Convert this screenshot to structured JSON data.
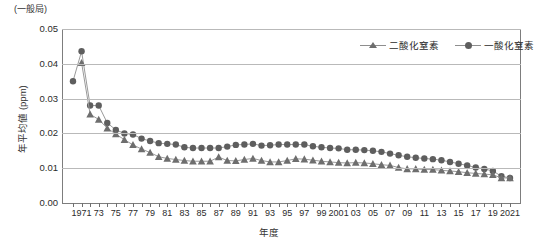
{
  "corner_note": "(一般局)",
  "axis": {
    "ylabel": "年平均値 (ppm)",
    "xlabel": "年度",
    "ytick_labels": [
      "0.05",
      "0.04",
      "0.03",
      "0.02",
      "0.01",
      "0.00"
    ]
  },
  "legend": {
    "position": "top-right",
    "items": [
      {
        "label": "二酸化窒素",
        "marker": "triangle",
        "color": "#6e6e6e"
      },
      {
        "label": "一酸化窒素",
        "marker": "circle",
        "color": "#5e5e5e"
      }
    ]
  },
  "chart_data": {
    "type": "line",
    "title": "",
    "subtitle": "(一般局)",
    "xlabel": "年度",
    "ylabel": "年平均値 (ppm)",
    "ylim": [
      0.0,
      0.05
    ],
    "ytick_values": [
      0.0,
      0.01,
      0.02,
      0.03,
      0.04,
      0.05
    ],
    "grid": "horizontal",
    "legend_position": "top-right",
    "x": [
      1970,
      1971,
      1972,
      1973,
      1974,
      1975,
      1976,
      1977,
      1978,
      1979,
      1980,
      1981,
      1982,
      1983,
      1984,
      1985,
      1986,
      1987,
      1988,
      1989,
      1990,
      1991,
      1992,
      1993,
      1994,
      1995,
      1996,
      1997,
      1998,
      1999,
      2000,
      2001,
      2002,
      2003,
      2004,
      2005,
      2006,
      2007,
      2008,
      2009,
      2010,
      2011,
      2012,
      2013,
      2014,
      2015,
      2016,
      2017,
      2018,
      2019,
      2020,
      2021
    ],
    "xtick_labels": [
      "1971",
      "73",
      "75",
      "77",
      "79",
      "81",
      "83",
      "85",
      "87",
      "89",
      "91",
      "93",
      "95",
      "97",
      "99",
      "2001",
      "03",
      "05",
      "07",
      "09",
      "11",
      "13",
      "15",
      "17",
      "19",
      "2021"
    ],
    "xtick_values": [
      1971,
      1973,
      1975,
      1977,
      1979,
      1981,
      1983,
      1985,
      1987,
      1989,
      1991,
      1993,
      1995,
      1997,
      1999,
      2001,
      2003,
      2005,
      2007,
      2009,
      2011,
      2013,
      2015,
      2017,
      2019,
      2021
    ],
    "series": [
      {
        "name": "一酸化窒素",
        "marker": "circle",
        "color": "#5e5e5e",
        "values": [
          0.035,
          0.0436,
          0.028,
          0.028,
          0.023,
          0.021,
          0.02,
          0.0197,
          0.0185,
          0.0178,
          0.0172,
          0.017,
          0.0168,
          0.016,
          0.0158,
          0.0158,
          0.0158,
          0.0158,
          0.0162,
          0.0167,
          0.0168,
          0.017,
          0.0165,
          0.0166,
          0.0168,
          0.0168,
          0.0168,
          0.0168,
          0.0163,
          0.016,
          0.0158,
          0.0157,
          0.0153,
          0.0153,
          0.0152,
          0.015,
          0.0147,
          0.0142,
          0.0137,
          0.0133,
          0.013,
          0.0128,
          0.0126,
          0.0123,
          0.0118,
          0.0113,
          0.0108,
          0.0102,
          0.0098,
          0.0092,
          0.0077,
          0.0072
        ]
      },
      {
        "name": "二酸化窒素",
        "marker": "triangle",
        "color": "#6e6e6e",
        "values": [
          null,
          0.0403,
          0.0255,
          0.024,
          0.0215,
          0.0198,
          0.0182,
          0.0167,
          0.0155,
          0.0145,
          0.0133,
          0.0128,
          0.0125,
          0.0122,
          0.012,
          0.012,
          0.012,
          0.0132,
          0.0122,
          0.0121,
          0.0125,
          0.0128,
          0.0122,
          0.0118,
          0.0118,
          0.0122,
          0.0127,
          0.0126,
          0.0123,
          0.012,
          0.0118,
          0.0116,
          0.0115,
          0.0116,
          0.0115,
          0.0113,
          0.011,
          0.0108,
          0.0102,
          0.0098,
          0.0098,
          0.0096,
          0.0096,
          0.0094,
          0.0092,
          0.009,
          0.0087,
          0.0085,
          0.0083,
          0.0081,
          0.0072,
          0.0072
        ]
      }
    ]
  }
}
